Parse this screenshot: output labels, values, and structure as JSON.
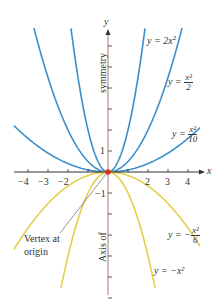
{
  "chart_data": {
    "type": "line",
    "title": "",
    "xlabel": "x",
    "ylabel": "y",
    "xlim": [
      -4.8,
      4.8
    ],
    "ylim": [
      -6,
      7
    ],
    "grid": false,
    "x_ticks": [
      -4,
      -3,
      -2,
      -1,
      1,
      2,
      3,
      4
    ],
    "x_tick_labels": [
      "−4",
      "−3",
      "−2",
      "2",
      "3",
      "4"
    ],
    "y_tick_labels": [
      "1",
      "−1"
    ],
    "series": [
      {
        "name": "y = 2x^2",
        "coef": 2,
        "color": "#3a8fc9"
      },
      {
        "name": "y = x^2/2",
        "coef": 0.5,
        "color": "#3a8fc9"
      },
      {
        "name": "y = x^2/10",
        "coef": 0.1,
        "color": "#3a8fc9"
      },
      {
        "name": "y = -x^2/6",
        "coef": -0.1667,
        "color": "#e3cf4a"
      },
      {
        "name": "y = -x^2",
        "coef": -1,
        "color": "#e3cf4a"
      }
    ],
    "annotations": [
      {
        "text": "Vertex at origin",
        "x": 0,
        "y": 0
      },
      {
        "text": "Axis of symmetry",
        "on": "y-axis"
      }
    ]
  },
  "labels": {
    "y_axis": "y",
    "x_axis": "x",
    "eq_2x2_prefix": "y = 2x",
    "eq_2x2_exp": "2",
    "eq_half_prefix": "y = ",
    "eq_half_num": "x²",
    "eq_half_den": "2",
    "eq_tenth_prefix": "y = ",
    "eq_tenth_num": "x²",
    "eq_tenth_den": "10",
    "eq_neg_sixth_prefix": "y = −",
    "eq_neg_sixth_num": "x²",
    "eq_neg_sixth_den": "6",
    "eq_neg_x2": "y = −x²",
    "vertex_line1": "Vertex at",
    "vertex_line2": "origin",
    "symmetry_top": "symmetry",
    "symmetry_bottom": "Axis of",
    "tick_neg4": "−4",
    "tick_neg3": "−3",
    "tick_neg2": "−2",
    "tick_2": "2",
    "tick_3": "3",
    "tick_4": "4",
    "tick_y1": "1",
    "tick_yneg1": "−1"
  },
  "colors": {
    "positive_curves": "#3a8fc9",
    "negative_curves": "#e3cf4a",
    "axis": "#333333",
    "y_axis": "#b07a6e",
    "vertex": "#e0301e"
  }
}
